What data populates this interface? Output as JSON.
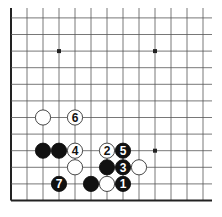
{
  "diagram": {
    "type": "go-board-fragment",
    "visible_edges": [
      "left",
      "bottom"
    ],
    "columns_visible": 13,
    "rows_visible": 12,
    "star_points": [
      {
        "col": 3,
        "row": 9
      },
      {
        "col": 9,
        "row": 9
      },
      {
        "col": 9,
        "row": 3
      }
    ],
    "stones": [
      {
        "color": "white",
        "col": 2,
        "row": 5,
        "label": ""
      },
      {
        "color": "white",
        "col": 4,
        "row": 5,
        "label": "6"
      },
      {
        "color": "black",
        "col": 2,
        "row": 3,
        "label": ""
      },
      {
        "color": "black",
        "col": 3,
        "row": 3,
        "label": ""
      },
      {
        "color": "white",
        "col": 4,
        "row": 3,
        "label": "4"
      },
      {
        "color": "white",
        "col": 6,
        "row": 3,
        "label": "2"
      },
      {
        "color": "black",
        "col": 7,
        "row": 3,
        "label": "5"
      },
      {
        "color": "white",
        "col": 4,
        "row": 2,
        "label": ""
      },
      {
        "color": "black",
        "col": 6,
        "row": 2,
        "label": ""
      },
      {
        "color": "black",
        "col": 7,
        "row": 2,
        "label": "3"
      },
      {
        "color": "white",
        "col": 8,
        "row": 2,
        "label": ""
      },
      {
        "color": "black",
        "col": 3,
        "row": 1,
        "label": "7"
      },
      {
        "color": "black",
        "col": 5,
        "row": 1,
        "label": ""
      },
      {
        "color": "white",
        "col": 6,
        "row": 1,
        "label": ""
      },
      {
        "color": "black",
        "col": 7,
        "row": 1,
        "label": "1"
      }
    ],
    "colors": {
      "line": "#555555",
      "edge": "#222222",
      "black_stone": "#111111",
      "white_stone": "#ffffff",
      "star": "#222222"
    }
  }
}
